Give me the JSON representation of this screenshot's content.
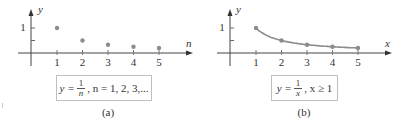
{
  "chart_data": [
    {
      "type": "scatter",
      "panel": "a",
      "caption": "(a)",
      "xlabel": "n",
      "ylabel": "y",
      "formula": {
        "lhs": "y =",
        "numerator": "1",
        "denominator": "n",
        "rest": ", n = 1, 2, 3,..."
      },
      "x_ticks": [
        "1",
        "2",
        "3",
        "4",
        "5"
      ],
      "y_ticks": [
        "1"
      ],
      "x": [
        1,
        2,
        3,
        4,
        5
      ],
      "y": [
        1,
        0.5,
        0.333,
        0.25,
        0.2
      ],
      "xlim": [
        0,
        6.5
      ],
      "ylim": [
        0,
        1.4
      ],
      "grid": false,
      "point_color": "#8c8c8c"
    },
    {
      "type": "line",
      "panel": "b",
      "caption": "(b)",
      "xlabel": "x",
      "ylabel": "y",
      "formula": {
        "lhs": "y =",
        "numerator": "1",
        "denominator": "x",
        "rest": ", x ≥ 1"
      },
      "x_ticks": [
        "1",
        "2",
        "3",
        "4",
        "5"
      ],
      "y_ticks": [
        "1"
      ],
      "x": [
        1,
        2,
        3,
        4,
        5
      ],
      "y": [
        1,
        0.5,
        0.333,
        0.25,
        0.2
      ],
      "xlim": [
        0,
        6.5
      ],
      "ylim": [
        0,
        1.4
      ],
      "grid": false,
      "line_color": "#8c8c8c"
    }
  ]
}
